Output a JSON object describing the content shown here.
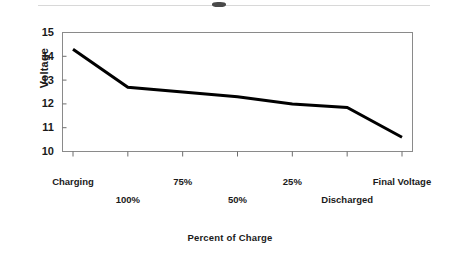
{
  "chart_data": {
    "type": "line",
    "title": "",
    "xlabel": "Percent of Charge",
    "ylabel": "Voltage",
    "categories": [
      "Charging",
      "100%",
      "75%",
      "50%",
      "25%",
      "Discharged",
      "Final Voltage"
    ],
    "values": [
      14.3,
      12.7,
      12.5,
      12.3,
      12.0,
      11.85,
      10.6
    ],
    "series": [
      {
        "name": "Voltage",
        "values": [
          14.3,
          12.7,
          12.5,
          12.3,
          12.0,
          11.85,
          10.6
        ]
      }
    ],
    "ylim": [
      10,
      15
    ],
    "yticks": [
      15,
      14,
      13,
      12,
      11,
      10
    ],
    "ytick_labels": [
      "15",
      "14",
      "13",
      "12",
      "11",
      "10"
    ],
    "xtick_labels": [
      "Charging",
      "100%",
      "75%",
      "50%",
      "25%",
      "Discharged",
      "Final Voltage"
    ],
    "grid": false,
    "legend": false,
    "legend_position": "none",
    "line_color": "#000000",
    "axis_color": "#808080",
    "background_color": "#ffffff"
  },
  "axes": {
    "y_title": "Voltage",
    "x_title": "Percent of Charge",
    "y_ticks": [
      {
        "label": "15",
        "value": 15
      },
      {
        "label": "14",
        "value": 14
      },
      {
        "label": "13",
        "value": 13
      },
      {
        "label": "12",
        "value": 12
      },
      {
        "label": "11",
        "value": 11
      },
      {
        "label": "10",
        "value": 10
      }
    ],
    "x_ticks": [
      {
        "label": "Charging",
        "row": 0
      },
      {
        "label": "100%",
        "row": 1
      },
      {
        "label": "75%",
        "row": 0
      },
      {
        "label": "50%",
        "row": 1
      },
      {
        "label": "25%",
        "row": 0
      },
      {
        "label": "Discharged",
        "row": 1
      },
      {
        "label": "Final Voltage",
        "row": 0
      }
    ]
  }
}
